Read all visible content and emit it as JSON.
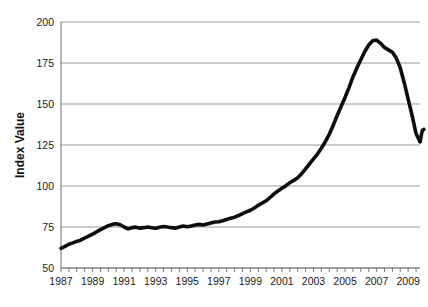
{
  "chart_data": {
    "type": "line",
    "title": "",
    "xlabel": "",
    "ylabel": "Index Value",
    "ylim": [
      50,
      200
    ],
    "xlim": [
      1987,
      2009.75
    ],
    "grid": true,
    "legend": "none",
    "y_ticks": [
      50,
      75,
      100,
      125,
      150,
      175,
      200
    ],
    "x_ticks": [
      1987,
      1989,
      1991,
      1993,
      1995,
      1997,
      1999,
      2001,
      2003,
      2005,
      2007,
      2009
    ],
    "x_tick_labels": [
      "1987",
      "1989",
      "1991",
      "1993",
      "1995",
      "1997",
      "1999",
      "2001",
      "2003",
      "2005",
      "2007",
      "2009"
    ],
    "y_tick_labels": [
      "50",
      "75",
      "100",
      "125",
      "150",
      "175",
      "200"
    ],
    "x_minor_tick_step": 0.5,
    "series": [
      {
        "name": "Index Value",
        "color": "#0d0d0d",
        "x": [
          1987.0,
          1987.25,
          1987.5,
          1987.75,
          1988.0,
          1988.25,
          1988.5,
          1988.75,
          1989.0,
          1989.25,
          1989.5,
          1989.75,
          1990.0,
          1990.25,
          1990.5,
          1990.75,
          1991.0,
          1991.25,
          1991.5,
          1991.75,
          1992.0,
          1992.25,
          1992.5,
          1992.75,
          1993.0,
          1993.25,
          1993.5,
          1993.75,
          1994.0,
          1994.25,
          1994.5,
          1994.75,
          1995.0,
          1995.25,
          1995.5,
          1995.75,
          1996.0,
          1996.25,
          1996.5,
          1996.75,
          1997.0,
          1997.25,
          1997.5,
          1997.75,
          1998.0,
          1998.25,
          1998.5,
          1998.75,
          1999.0,
          1999.25,
          1999.5,
          1999.75,
          2000.0,
          2000.25,
          2000.5,
          2000.75,
          2001.0,
          2001.25,
          2001.5,
          2001.75,
          2002.0,
          2002.25,
          2002.5,
          2002.75,
          2003.0,
          2003.25,
          2003.5,
          2003.75,
          2004.0,
          2004.25,
          2004.5,
          2004.75,
          2005.0,
          2005.25,
          2005.5,
          2005.75,
          2006.0,
          2006.25,
          2006.5,
          2006.75,
          2007.0,
          2007.25,
          2007.5,
          2007.75,
          2008.0,
          2008.25,
          2008.5,
          2008.75,
          2009.0,
          2009.25,
          2009.5,
          2009.75
        ],
        "values": [
          62.0,
          63.2,
          64.5,
          65.3,
          66.2,
          67.0,
          68.3,
          69.5,
          70.6,
          72.0,
          73.4,
          74.6,
          75.8,
          76.6,
          77.0,
          76.4,
          75.0,
          73.9,
          74.6,
          74.9,
          74.3,
          74.6,
          75.0,
          74.6,
          74.2,
          74.8,
          75.3,
          75.0,
          74.6,
          74.3,
          75.0,
          75.6,
          75.2,
          75.6,
          76.2,
          76.6,
          76.2,
          76.8,
          77.4,
          78.0,
          78.2,
          78.8,
          79.6,
          80.4,
          81.0,
          82.0,
          83.2,
          84.2,
          85.2,
          86.6,
          88.2,
          89.6,
          91.0,
          93.0,
          95.2,
          97.0,
          98.6,
          100.2,
          102.0,
          103.4,
          105.0,
          107.5,
          110.5,
          113.5,
          116.5,
          119.5,
          123.0,
          127.0,
          131.5,
          137.0,
          143.0,
          148.5,
          154.0,
          160.0,
          166.5,
          172.0,
          177.0,
          182.0,
          186.0,
          188.5,
          189.0,
          187.0,
          184.5,
          183.0,
          181.5,
          178.0,
          172.0,
          163.0,
          153.0,
          143.0,
          132.0,
          127.0
        ]
      },
      {
        "name": "Index Value (recovery tail)",
        "color": "#0d0d0d",
        "x": [
          2009.75,
          2009.9,
          2010.0
        ],
        "values": [
          127.0,
          134.0,
          134.5
        ]
      }
    ],
    "peak": {
      "year": 2006.0,
      "value": 189.0
    },
    "trough_shown": {
      "year": 2009.75,
      "value": 127.0
    },
    "start": {
      "year": 1987.0,
      "value": 62.0
    }
  },
  "figure": {
    "background": "#ffffff",
    "line_color": "#0d0d0d",
    "grid_color": "#8d8d8d",
    "axis_color": "#7a7a7a",
    "text_color": "#1a1a1a"
  },
  "caption": {
    "partial_text": ""
  }
}
